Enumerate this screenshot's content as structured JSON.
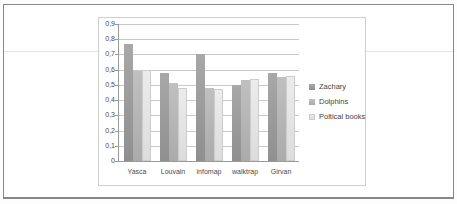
{
  "page": {
    "border_color": "#878787",
    "background": "#ffffff"
  },
  "chart_data": {
    "type": "bar",
    "title": "",
    "xlabel": "",
    "ylabel": "",
    "categories": [
      "Yasca",
      "Louvain",
      "infomap",
      "walktrap",
      "Girvan"
    ],
    "series": [
      {
        "name": "Zachary",
        "color": "#8f8f8f",
        "color_light": "#a8a8a8",
        "border": "",
        "values": [
          0.77,
          0.58,
          0.7,
          0.5,
          0.58
        ]
      },
      {
        "name": "Dolphins",
        "color": "#ababab",
        "color_light": "#c0c0c0",
        "border": "",
        "values": [
          0.59,
          0.51,
          0.48,
          0.53,
          0.55
        ]
      },
      {
        "name": "Poltical books",
        "color": "#dcdcdc",
        "color_light": "#ececec",
        "border": "#cccccc",
        "values": [
          0.6,
          0.48,
          0.47,
          0.54,
          0.56
        ]
      }
    ],
    "ylim": [
      0,
      0.9
    ],
    "ytick_step": 0.1,
    "ytick_labels": [
      "0",
      "0,1",
      "0,2",
      "0,3",
      "0,4",
      "0,5",
      "0,6",
      "0,7",
      "0,8",
      "0,9"
    ],
    "grid": true,
    "gridline_color": "#c9c9c9",
    "legend_position": "right"
  }
}
